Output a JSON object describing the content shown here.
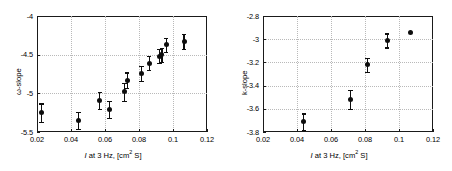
{
  "figure": {
    "panels": [
      {
        "name": "omega-slope-panel",
        "ylabel": "ω-slope",
        "xlabel_prefix": "I",
        "xlabel_mid": " at 3 Hz, [cm",
        "xlabel_sup": "2",
        "xlabel_suffix": " S]",
        "xticks": [
          "0.02",
          "0.04",
          "0.06",
          "0.08",
          "0.1",
          "0.12"
        ],
        "yticks": [
          "-4",
          "-4.5",
          "-5",
          "-5.5"
        ]
      },
      {
        "name": "k-slope-panel",
        "ylabel": "k-slope",
        "xlabel_prefix": "I",
        "xlabel_mid": " at 3 Hz, [cm",
        "xlabel_sup": "2",
        "xlabel_suffix": " S]",
        "xticks": [
          "0.02",
          "0.04",
          "0.06",
          "0.08",
          "0.1",
          "0.12"
        ],
        "yticks": [
          "-2.8",
          "-3",
          "-3.2",
          "-3.4",
          "-3.6",
          "-3.8"
        ]
      }
    ]
  },
  "chart_data": [
    {
      "type": "scatter",
      "title": "",
      "xlabel": "I at 3 Hz, [cm2 S]",
      "ylabel": "ω-slope",
      "xlim": [
        0.02,
        0.12
      ],
      "ylim": [
        -5.5,
        -4.0
      ],
      "xticks": [
        0.02,
        0.04,
        0.06,
        0.08,
        0.1,
        0.12
      ],
      "yticks": [
        -4.0,
        -4.5,
        -5.0,
        -5.5
      ],
      "grid": true,
      "legend": null,
      "marker": "filled-circle",
      "errorbars": "symmetric-vertical",
      "color": "#0d0d0d",
      "points": [
        {
          "x": 0.0225,
          "y": -5.25,
          "yerr": 0.12
        },
        {
          "x": 0.0445,
          "y": -5.35,
          "yerr": 0.11
        },
        {
          "x": 0.057,
          "y": -5.09,
          "yerr": 0.11
        },
        {
          "x": 0.0625,
          "y": -5.21,
          "yerr": 0.11
        },
        {
          "x": 0.0715,
          "y": -4.98,
          "yerr": 0.12
        },
        {
          "x": 0.073,
          "y": -4.83,
          "yerr": 0.1
        },
        {
          "x": 0.0815,
          "y": -4.74,
          "yerr": 0.1
        },
        {
          "x": 0.086,
          "y": -4.61,
          "yerr": 0.09
        },
        {
          "x": 0.092,
          "y": -4.52,
          "yerr": 0.09
        },
        {
          "x": 0.0935,
          "y": -4.5,
          "yerr": 0.09
        },
        {
          "x": 0.096,
          "y": -4.37,
          "yerr": 0.09
        },
        {
          "x": 0.1065,
          "y": -4.33,
          "yerr": 0.1
        }
      ]
    },
    {
      "type": "scatter",
      "title": "",
      "xlabel": "I at 3 Hz, [cm2 S]",
      "ylabel": "k-slope",
      "xlim": [
        0.02,
        0.12
      ],
      "ylim": [
        -3.8,
        -2.8
      ],
      "xticks": [
        0.02,
        0.04,
        0.06,
        0.08,
        0.1,
        0.12
      ],
      "yticks": [
        -2.8,
        -3.0,
        -3.2,
        -3.4,
        -3.6,
        -3.8
      ],
      "grid": true,
      "legend": null,
      "marker": "filled-circle",
      "errorbars": "symmetric-vertical",
      "color": "#0d0d0d",
      "points": [
        {
          "x": 0.044,
          "y": -3.71,
          "yerr": 0.07
        },
        {
          "x": 0.0715,
          "y": -3.52,
          "yerr": 0.08
        },
        {
          "x": 0.0815,
          "y": -3.22,
          "yerr": 0.06
        },
        {
          "x": 0.093,
          "y": -3.01,
          "yerr": 0.06
        },
        {
          "x": 0.107,
          "y": -2.94,
          "yerr": 0.01
        }
      ]
    }
  ]
}
